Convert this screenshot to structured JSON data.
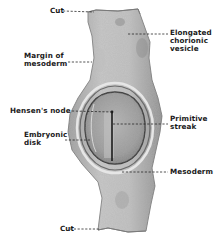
{
  "figure": {
    "colors": {
      "background": "#ffffff",
      "tissue_light": "#d4d4d4",
      "tissue_mid": "#a8a8a8",
      "tissue_dark": "#5a5a5a",
      "label_text": "#1a1a1a"
    },
    "labels": {
      "cut_top": "Cut",
      "elongated_chorionic_vesicle": "Elongated\nchorionic\nvesicle",
      "margin_of_mesoderm": "Margin of\nmesoderm",
      "hensens_node": "Hensen's node",
      "primitive_streak": "Primitive\nstreak",
      "embryonic_disk": "Embryonic\ndisk",
      "mesoderm": "Mesoderm",
      "cut_bottom": "Cut"
    }
  }
}
